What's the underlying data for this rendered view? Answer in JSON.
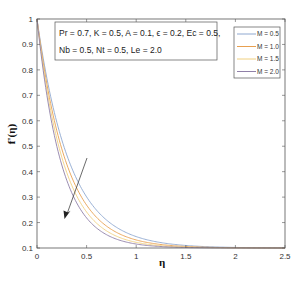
{
  "chart_data": {
    "type": "line",
    "title": "",
    "xlabel": "η",
    "ylabel": "f'(η)",
    "xlim": [
      0,
      2.5
    ],
    "ylim": [
      0.1,
      1.0
    ],
    "xticks": [
      "0",
      "0.5",
      "1",
      "1.5",
      "2",
      "2.5"
    ],
    "yticks": [
      "0.1",
      "0.2",
      "0.3",
      "0.4",
      "0.5",
      "0.6",
      "0.7",
      "0.8",
      "0.9",
      "1"
    ],
    "grid": false,
    "legend_position": "upper right",
    "x": [
      0,
      0.1,
      0.2,
      0.3,
      0.4,
      0.5,
      0.6,
      0.7,
      0.8,
      0.9,
      1.0,
      1.2,
      1.4,
      1.6,
      1.8,
      2.0,
      2.2,
      2.5
    ],
    "series": [
      {
        "name": "M = 0.5",
        "color": "#8fa8d0",
        "decay": 3.0,
        "values": [
          1.0,
          0.767,
          0.594,
          0.466,
          0.372,
          0.301,
          0.249,
          0.211,
          0.182,
          0.161,
          0.145,
          0.124,
          0.113,
          0.107,
          0.104,
          0.102,
          0.101,
          0.1
        ]
      },
      {
        "name": "M = 1.0",
        "color": "#e8a050",
        "decay": 3.35,
        "values": [
          1.0,
          0.744,
          0.563,
          0.433,
          0.342,
          0.275,
          0.228,
          0.195,
          0.17,
          0.152,
          0.139,
          0.12,
          0.11,
          0.104,
          0.102,
          0.101,
          0.1,
          0.1
        ]
      },
      {
        "name": "M = 1.5",
        "color": "#f0d080",
        "decay": 3.7,
        "values": [
          1.0,
          0.723,
          0.533,
          0.405,
          0.316,
          0.253,
          0.21,
          0.18,
          0.158,
          0.143,
          0.133,
          0.116,
          0.107,
          0.103,
          0.101,
          0.1,
          0.1,
          0.1
        ]
      },
      {
        "name": "M = 2.0",
        "color": "#9080a8",
        "decay": 4.06,
        "values": [
          1.0,
          0.699,
          0.499,
          0.368,
          0.28,
          0.218,
          0.179,
          0.152,
          0.134,
          0.123,
          0.115,
          0.107,
          0.103,
          0.101,
          0.1,
          0.1,
          0.1,
          0.1
        ]
      }
    ],
    "annotations": [
      {
        "type": "textbox",
        "lines": [
          "Pr = 0.7, K = 0.5, A = 0.1, ϵ = 0.2, Ec = 0.5,",
          "Nb = 0.5, Nt = 0.5, Le = 2.0"
        ]
      },
      {
        "type": "arrow",
        "from": [
          0.5,
          0.46
        ],
        "to": [
          0.28,
          0.21
        ],
        "meaning": "increasing M"
      }
    ]
  }
}
